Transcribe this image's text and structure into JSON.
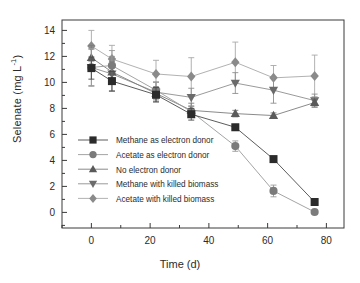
{
  "chart_data": {
    "type": "line",
    "title": "",
    "xlabel": "Time (d)",
    "ylabel_text": "Selenate (mg L",
    "ylabel_sup": "-1",
    "ylabel_tail": ")",
    "xlim": [
      -10,
      86
    ],
    "ylim": [
      -1.2,
      14.8
    ],
    "xticks": [
      0,
      20,
      40,
      60,
      80
    ],
    "yticks": [
      0,
      2,
      4,
      6,
      8,
      10,
      12,
      14
    ],
    "xtick_labels": [
      "0",
      "20",
      "40",
      "60",
      "80"
    ],
    "ytick_labels": [
      "0",
      "2",
      "4",
      "6",
      "8",
      "10",
      "12",
      "14"
    ],
    "grid": false,
    "legend_position": "center-left",
    "x": [
      0,
      7,
      22,
      34,
      49,
      62,
      76
    ],
    "series": [
      {
        "name": "Methane as electron donor",
        "marker": "square",
        "color": "#2b2b2b",
        "line_color": "#4a4a4a",
        "values": [
          11.1,
          10.1,
          9.05,
          7.55,
          6.55,
          4.1,
          0.8
        ],
        "errors": [
          0.85,
          0.75,
          0.55,
          0.45,
          0.2,
          0.2,
          0.15
        ]
      },
      {
        "name": "Acetate as electron donor",
        "marker": "circle",
        "color": "#7b7b7b",
        "line_color": "#9a9a9a",
        "values": [
          11.15,
          11.3,
          9.4,
          7.75,
          5.1,
          1.65,
          0.03
        ],
        "errors": [
          1.45,
          1.15,
          0.65,
          0.45,
          0.4,
          0.45,
          0.12
        ]
      },
      {
        "name": "No electron donor",
        "marker": "triangle-up",
        "color": "#5a5a5a",
        "line_color": "#7d7d7d",
        "values": [
          11.9,
          10.8,
          9.15,
          7.85,
          7.6,
          7.45,
          8.45
        ],
        "errors": [
          0.95,
          0.8,
          0.5,
          0.55,
          0.25,
          0.2,
          0.35
        ]
      },
      {
        "name": "Methane with killed biomass",
        "marker": "triangle-down",
        "color": "#6b6b6b",
        "line_color": "#8f8f8f",
        "values": [
          11.15,
          10.65,
          9.25,
          8.85,
          9.95,
          9.4,
          8.6
        ],
        "errors": [
          1.4,
          1.35,
          0.75,
          0.7,
          0.8,
          1.0,
          0.5
        ]
      },
      {
        "name": "Acetate with killed biomass",
        "marker": "diamond",
        "color": "#8a8a8a",
        "line_color": "#a8a8a8",
        "values": [
          12.8,
          11.8,
          10.65,
          10.45,
          11.55,
          10.35,
          10.5
        ],
        "errors": [
          1.2,
          1.05,
          1.05,
          1.45,
          1.55,
          0.95,
          1.6
        ]
      }
    ]
  },
  "legend": {
    "entries": [
      "Methane as electron donor",
      "Acetate as electron donor",
      "No electron donor",
      "Methane with killed biomass",
      "Acetate with killed biomass"
    ]
  },
  "colors": {
    "axis": "#3a3a3a",
    "text": "#2b2b2b",
    "background": "#ffffff"
  }
}
